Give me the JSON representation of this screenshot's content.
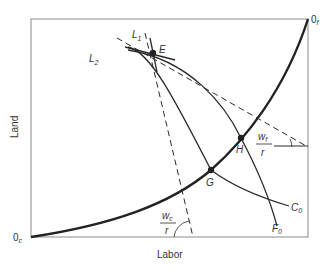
{
  "diagram": {
    "type": "edgeworth-box",
    "axes": {
      "x_label": "Labor",
      "y_label": "Land"
    },
    "origins": {
      "cloth": {
        "label": "0",
        "sub": "c"
      },
      "food": {
        "label": "0",
        "sub": "f"
      }
    },
    "lines": {
      "L1": {
        "label": "L",
        "sub": "1"
      },
      "L2": {
        "label": "L",
        "sub": "2"
      }
    },
    "curves": {
      "C0": {
        "label": "C",
        "sub": "0"
      },
      "F0": {
        "label": "F",
        "sub": "0"
      }
    },
    "points": {
      "E": "E",
      "G": "G",
      "H": "H"
    },
    "ratios": {
      "food": {
        "num": "w",
        "num_sub": "f",
        "den": "r"
      },
      "cloth": {
        "num": "w",
        "num_sub": "c",
        "den": "r"
      }
    },
    "colors": {
      "line": "#2a2a2a",
      "frame": "#777777"
    }
  }
}
